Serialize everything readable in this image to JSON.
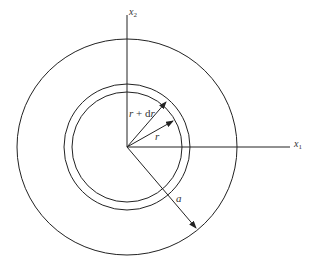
{
  "diagram": {
    "center": {
      "x": 127,
      "y": 147
    },
    "outer_circle_radius": 110,
    "ring_outer_radius": 63,
    "ring_inner_radius": 55,
    "stroke_color": "#222222",
    "axes": {
      "x1_label": "x",
      "x1_sub": "1",
      "x2_label": "x",
      "x2_sub": "2"
    },
    "labels": {
      "r_plus_dr": "r + dr",
      "r": "r",
      "a": "a"
    }
  }
}
